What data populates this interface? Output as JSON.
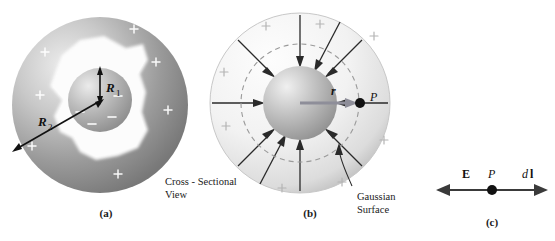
{
  "figure": {
    "background_color": "#ffffff"
  },
  "colors": {
    "ink": "#1a1a1a",
    "shell_a_dark": "#7e7e7e",
    "shell_a_light": "#d8d8d8",
    "shell_b_dark": "#cfcfcf",
    "shell_b_light": "#fbfbfb",
    "inner_sphere_dark": "#8a8a8a",
    "inner_sphere_light": "#e8e8e8",
    "cavity_white": "#fdfdfd",
    "charge_sign_white": "#ffffff",
    "dashed_gaussian": "#9a9a9a",
    "r_vector_gray": "#8e8e99"
  },
  "panels": [
    {
      "id": "a",
      "label": "(a)",
      "caption": "Cross - Sectional\nView",
      "radius_labels": [
        {
          "name": "R1",
          "base": "R",
          "subscript": "1",
          "description": "radius of inner charged sphere"
        },
        {
          "name": "R2",
          "base": "R",
          "subscript": "2",
          "description": "outer radius of surrounding shell"
        }
      ],
      "inner_sphere_charge": "negative",
      "inner_sphere_sign_glyph": "−",
      "inner_sphere_sign_count": 4,
      "shell_charge": "positive",
      "shell_sign_glyph": "+",
      "shell_sign_count": 7
    },
    {
      "id": "b",
      "label": "(b)",
      "caption": "Gaussian\nSurface",
      "point_label": "P",
      "vector_label": "r",
      "field_direction": "inward",
      "field_line_count": 10,
      "gaussian_surface_style": "dashed circle through P",
      "shell_sign_glyph": "+",
      "shell_sign_count": 8
    },
    {
      "id": "c",
      "label": "(c)",
      "left_label": "E",
      "center_label": "P",
      "right_label_italic": "d",
      "right_label_bold": "l",
      "arrow_style": "double-headed horizontal"
    }
  ]
}
